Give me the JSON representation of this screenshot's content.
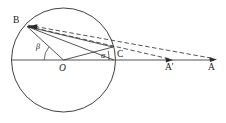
{
  "figure": {
    "type": "geometry-diagram",
    "title": "",
    "background_color": "#ffffff",
    "stroke_color": "#2b2b2b",
    "label_color": "#1a1a1a",
    "width": 226,
    "height": 123,
    "circle": {
      "center_label": "O",
      "center": [
        63.5,
        60
      ],
      "radius": 52
    },
    "points": [
      {
        "name": "B",
        "label": "B",
        "x": 26,
        "y": 26,
        "label_x": 14,
        "label_y": 19
      },
      {
        "name": "O",
        "label": "O",
        "x": 63.5,
        "y": 60,
        "label_x": 60,
        "label_y": 65
      },
      {
        "name": "C",
        "label": "C",
        "x": 114,
        "y": 60,
        "label_x": 117,
        "label_y": 50
      },
      {
        "name": "Ap",
        "label": "A'",
        "x": 172,
        "y": 60,
        "label_x": 166,
        "label_y": 64
      },
      {
        "name": "A",
        "label": "A",
        "x": 216,
        "y": 60,
        "label_x": 209,
        "label_y": 64
      }
    ],
    "angles": [
      {
        "name": "beta",
        "label": "β",
        "vertex": "O",
        "label_x": 36,
        "label_y": 44
      },
      {
        "name": "alpha",
        "label": "α",
        "vertex": "O",
        "label_x": 101,
        "label_y": 53
      }
    ],
    "solid_segments": [
      {
        "name": "baseline",
        "from": [
          12,
          60
        ],
        "to": [
          216,
          60
        ]
      },
      {
        "name": "segment-O-B",
        "from": [
          63.5,
          60
        ],
        "to": [
          26,
          26
        ]
      },
      {
        "name": "segment-B-C",
        "from": [
          26,
          26
        ],
        "to": [
          114,
          60
        ]
      },
      {
        "name": "segment-O-Cup",
        "from": [
          63.5,
          60
        ],
        "to": [
          113,
          47
        ]
      },
      {
        "name": "segment-B-Cup",
        "from": [
          26,
          26
        ],
        "to": [
          113,
          47
        ]
      }
    ],
    "dashed_segments": [
      {
        "name": "dashed-B-Aprime",
        "from": [
          26,
          26
        ],
        "to": [
          172,
          60
        ]
      },
      {
        "name": "dashed-B-A",
        "from": [
          26,
          26
        ],
        "to": [
          216,
          60
        ]
      }
    ],
    "arrows": [
      {
        "name": "arrow-at-B",
        "x": 30,
        "y": 27,
        "direction": "left"
      },
      {
        "name": "arrow-at-Aprime",
        "x": 172,
        "y": 60,
        "direction": "right"
      },
      {
        "name": "arrow-at-A",
        "x": 216,
        "y": 60,
        "direction": "right"
      }
    ],
    "arc_markers": [
      {
        "name": "arc-beta",
        "cx": 63.5,
        "cy": 60,
        "r": 26,
        "start_deg": 138,
        "end_deg": 180
      },
      {
        "name": "arc-alpha",
        "cx": 63.5,
        "cy": 60,
        "r": 34,
        "start_deg": 345,
        "end_deg": 360
      }
    ]
  }
}
